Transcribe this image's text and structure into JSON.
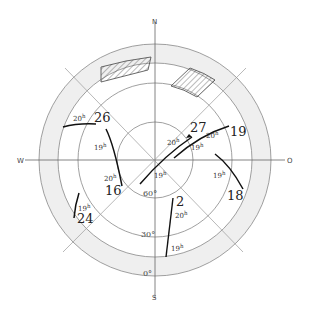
{
  "diagram": {
    "type": "polar sky chart",
    "cardinal_directions": {
      "north": "N",
      "south": "S",
      "west": "W",
      "east": "O"
    },
    "altitude_circles": [
      {
        "label": "60°",
        "radius": 38
      },
      {
        "label": "30°",
        "radius": 77
      },
      {
        "label": "0°",
        "radius": 97
      }
    ],
    "horizon_band": {
      "inner_radius": 97,
      "outer_radius": 116,
      "color": "#efefef"
    },
    "tracks": [
      {
        "id": "26",
        "label": "26",
        "hour_label": "20h"
      },
      {
        "id": "16",
        "label": "16",
        "hour_labels": [
          "19h",
          "20h"
        ]
      },
      {
        "id": "24",
        "label": "24",
        "hour_label": "19h"
      },
      {
        "id": "27",
        "label": "27",
        "hour_labels": [
          "20h",
          "19h"
        ]
      },
      {
        "id": "19",
        "label": "19",
        "hour_labels": [
          "20h",
          "19h"
        ]
      },
      {
        "id": "18",
        "label": "18",
        "hour_label": "19h"
      },
      {
        "id": "2",
        "label": "2",
        "hour_labels": [
          "20h",
          "19h"
        ]
      }
    ],
    "hatched_regions": 2
  },
  "labels": {
    "n": "N",
    "s": "S",
    "w": "W",
    "o": "O",
    "alt60": "60°",
    "alt30": "30°",
    "alt0": "0°",
    "t26": "26",
    "t16": "16",
    "t24": "24",
    "t27": "27",
    "t19": "19",
    "t18": "18",
    "t2": "2",
    "h": "h",
    "n20": "20",
    "n19": "19"
  }
}
